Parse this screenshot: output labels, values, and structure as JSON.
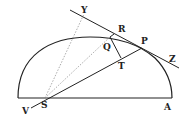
{
  "diagram": {
    "type": "geometric-figure",
    "colors": {
      "ink": "#222222",
      "dotted": "#888888",
      "background": "#ffffff"
    },
    "labels": {
      "Y": "Y",
      "R": "R",
      "Q": "Q",
      "P": "P",
      "T": "T",
      "Z": "Z",
      "V": "V",
      "S": "S",
      "A": "A"
    },
    "points": {
      "Y": [
        84,
        12
      ],
      "R": [
        114,
        34
      ],
      "Q": [
        110,
        37
      ],
      "P": [
        142,
        48
      ],
      "T": [
        121,
        58
      ],
      "S": [
        45,
        98
      ],
      "A": [
        172,
        98
      ],
      "V": [
        31,
        108
      ]
    }
  }
}
